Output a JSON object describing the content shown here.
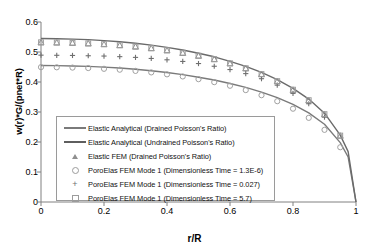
{
  "chart_data": {
    "type": "line",
    "title": "",
    "xlabel": "r/R",
    "ylabel": "w(r)*G/(pnet*R)",
    "xlim": [
      0,
      1
    ],
    "ylim": [
      0,
      0.6
    ],
    "xticks": [
      "0",
      "0.2",
      "0.4",
      "0.6",
      "0.8",
      "1"
    ],
    "yticks": [
      "0",
      "0.1",
      "0.2",
      "0.3",
      "0.4",
      "0.5",
      "0.6"
    ],
    "grid": false,
    "legend_position": "lower-left-inside",
    "series": [
      {
        "name": "Elastic Analytical (Drained Poisson's Ratio)",
        "marker": "line",
        "color": "#7a7a7a",
        "x": [
          0,
          0.05,
          0.1,
          0.15,
          0.2,
          0.25,
          0.3,
          0.35,
          0.4,
          0.45,
          0.5,
          0.55,
          0.6,
          0.65,
          0.7,
          0.75,
          0.8,
          0.85,
          0.9,
          0.95,
          0.975,
          1
        ],
        "values": [
          0.455,
          0.4545,
          0.4535,
          0.452,
          0.4495,
          0.4465,
          0.4425,
          0.4375,
          0.4315,
          0.4245,
          0.416,
          0.4065,
          0.395,
          0.382,
          0.3665,
          0.348,
          0.3255,
          0.297,
          0.259,
          0.198,
          0.15,
          0.0
        ]
      },
      {
        "name": "Elastic Analytical (Undrained Poisson's Ratio)",
        "marker": "line",
        "color": "#6a6a6a",
        "x": [
          0,
          0.05,
          0.1,
          0.15,
          0.2,
          0.25,
          0.3,
          0.35,
          0.4,
          0.45,
          0.5,
          0.55,
          0.6,
          0.65,
          0.7,
          0.75,
          0.8,
          0.85,
          0.9,
          0.95,
          0.975,
          1
        ],
        "values": [
          0.545,
          0.5443,
          0.543,
          0.5412,
          0.538,
          0.534,
          0.529,
          0.523,
          0.5155,
          0.5065,
          0.496,
          0.484,
          0.469,
          0.452,
          0.432,
          0.408,
          0.379,
          0.343,
          0.296,
          0.223,
          0.168,
          0.0
        ]
      },
      {
        "name": "Elastic FEM (Drained Poisson's Ratio)",
        "marker": "triangle",
        "color": "#8f8f8f",
        "x": [
          0,
          0.05,
          0.1,
          0.15,
          0.2,
          0.25,
          0.3,
          0.35,
          0.4,
          0.45,
          0.5,
          0.55,
          0.6,
          0.65,
          0.7,
          0.75,
          0.8,
          0.85,
          0.9,
          0.95
        ],
        "values": [
          0.532,
          0.5315,
          0.5305,
          0.5285,
          0.526,
          0.5225,
          0.518,
          0.5125,
          0.5055,
          0.497,
          0.4875,
          0.476,
          0.462,
          0.4455,
          0.426,
          0.4025,
          0.374,
          0.339,
          0.2925,
          0.221
        ]
      },
      {
        "name": "PoroElas FEM Mode 1 (Dimensionless Time = 1.3E-6)",
        "marker": "circle",
        "color": "#a0a0a0",
        "x": [
          0,
          0.05,
          0.1,
          0.15,
          0.2,
          0.25,
          0.3,
          0.35,
          0.4,
          0.45,
          0.5,
          0.55,
          0.6,
          0.65,
          0.7,
          0.75,
          0.8,
          0.85,
          0.9,
          0.95
        ],
        "values": [
          0.4495,
          0.449,
          0.448,
          0.4465,
          0.444,
          0.441,
          0.437,
          0.432,
          0.4255,
          0.4185,
          0.4095,
          0.3995,
          0.3875,
          0.373,
          0.356,
          0.336,
          0.311,
          0.2805,
          0.2405,
          0.1825
        ]
      },
      {
        "name": "PoroElas FEM Mode 1 (Dimensionless Time = 0.027)",
        "marker": "plus",
        "color": "#6f6f6f",
        "x": [
          0,
          0.05,
          0.1,
          0.15,
          0.2,
          0.25,
          0.3,
          0.35,
          0.4,
          0.45,
          0.5,
          0.55,
          0.6,
          0.65,
          0.7,
          0.75,
          0.8,
          0.85,
          0.9
        ],
        "values": [
          0.4895,
          0.489,
          0.4885,
          0.4875,
          0.4865,
          0.4845,
          0.482,
          0.4785,
          0.474,
          0.4685,
          0.4615,
          0.4525,
          0.4415,
          0.428,
          0.411,
          0.3895,
          0.362,
          0.3275,
          0.283
        ]
      },
      {
        "name": "PoroElas FEM Mode 1 (Dimensionless Time = 5.7)",
        "marker": "square",
        "color": "#9c9c9c",
        "x": [
          0,
          0.05,
          0.1,
          0.15,
          0.2,
          0.25,
          0.3,
          0.35,
          0.4,
          0.45,
          0.5,
          0.55,
          0.6,
          0.65,
          0.7,
          0.75,
          0.8,
          0.85,
          0.9,
          0.95
        ],
        "values": [
          0.5325,
          0.532,
          0.531,
          0.529,
          0.5265,
          0.523,
          0.5185,
          0.513,
          0.506,
          0.4975,
          0.488,
          0.4765,
          0.4625,
          0.446,
          0.4265,
          0.403,
          0.3745,
          0.3395,
          0.293,
          0.2215
        ]
      }
    ]
  },
  "legend": {
    "items": [
      {
        "label": "Elastic Analytical (Drained Poisson's Ratio)",
        "key": "line"
      },
      {
        "label": "Elastic Analytical (Undrained Poisson's Ratio)",
        "key": "line"
      },
      {
        "label": "Elastic FEM (Drained Poisson's Ratio)",
        "key": "triangle"
      },
      {
        "label": "PoroElas FEM Mode 1 (Dimensionless Time = 1.3E-6)",
        "key": "circle"
      },
      {
        "label": "PoroElas FEM Mode 1 (Dimensionless Time = 0.027)",
        "key": "plus"
      },
      {
        "label": "PoroElas FEM Mode 1 (Dimensionless Time = 5.7)",
        "key": "square"
      }
    ]
  }
}
